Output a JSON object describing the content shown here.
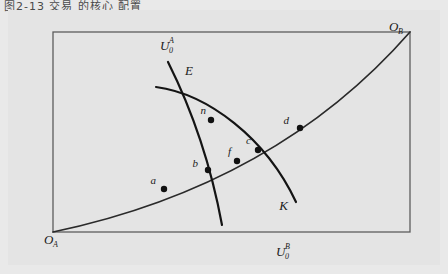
{
  "caption": "图2-13 交易 的核心 配置",
  "figure": {
    "background_color": "#e4e4e4",
    "frame_color": "#5c5c5c",
    "curve_color": "#141414"
  },
  "chart_data": {
    "type": "scatter",
    "title": "",
    "xlabel": "",
    "ylabel": "",
    "box": {
      "x0": 45,
      "y0": 22,
      "x1": 402,
      "y1": 222
    },
    "grid": false,
    "legend": false,
    "corner_labels": [
      {
        "name": "origin-a",
        "text": "O",
        "sub": "A",
        "x": 36,
        "y": 234
      },
      {
        "name": "origin-b",
        "text": "O",
        "sub": "B",
        "x": 381,
        "y": 21
      }
    ],
    "curve_labels": [
      {
        "name": "utility-a",
        "text": "U",
        "sub": "0",
        "sup": "A",
        "x": 152,
        "y": 40
      },
      {
        "name": "utility-b",
        "text": "U",
        "sub": "0",
        "sup": "B",
        "x": 268,
        "y": 246
      }
    ],
    "points": [
      {
        "label": "E",
        "x": 175,
        "y": 68,
        "label_x": 185,
        "label_y": 65,
        "dot": false
      },
      {
        "label": "n",
        "x": 203,
        "y": 110,
        "label_x": 198,
        "label_y": 104,
        "dot": true
      },
      {
        "label": "d",
        "x": 292,
        "y": 118,
        "label_x": 281,
        "label_y": 114,
        "dot": true
      },
      {
        "label": "c",
        "x": 250,
        "y": 140,
        "label_x": 243,
        "label_y": 134,
        "dot": true
      },
      {
        "label": "f",
        "x": 229,
        "y": 151,
        "label_x": 223,
        "label_y": 145,
        "dot": true
      },
      {
        "label": "b",
        "x": 200,
        "y": 160,
        "label_x": 190,
        "label_y": 157,
        "dot": true
      },
      {
        "label": "a",
        "x": 156,
        "y": 179,
        "label_x": 148,
        "label_y": 174,
        "dot": true
      },
      {
        "label": "K",
        "x": 272,
        "y": 203,
        "label_x": 280,
        "label_y": 200,
        "dot": false
      }
    ],
    "series": [
      {
        "name": "U0^A",
        "type": "indifference-curve",
        "path": "M 160 52 C 182 96, 202 150, 214 215"
      },
      {
        "name": "U0^B",
        "type": "indifference-curve",
        "path": "M 148 77 C 200 84, 258 128, 288 192"
      },
      {
        "name": "contract-curve",
        "type": "contract-curve",
        "path": "M 45 222 C 150 200, 290 150, 402 22"
      }
    ]
  }
}
